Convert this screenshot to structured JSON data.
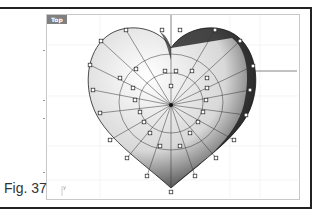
{
  "figure": {
    "label": "Fig. 37"
  },
  "viewport": {
    "title": "Top",
    "axis_label": "y",
    "grid_color": "#ececec",
    "axis_color": "#555555"
  },
  "model": {
    "name": "heart-surface",
    "center": [
      171,
      105
    ],
    "control_points": [
      [
        126,
        30
      ],
      [
        162,
        30
      ],
      [
        180,
        30
      ],
      [
        215,
        30
      ],
      [
        101,
        41
      ],
      [
        240,
        41
      ],
      [
        90,
        65
      ],
      [
        253,
        66
      ],
      [
        93,
        90
      ],
      [
        250,
        90
      ],
      [
        100,
        113
      ],
      [
        246,
        115
      ],
      [
        110,
        140
      ],
      [
        234,
        140
      ],
      [
        127,
        158
      ],
      [
        216,
        158
      ],
      [
        147,
        176
      ],
      [
        195,
        176
      ],
      [
        171,
        192
      ],
      [
        136,
        69
      ],
      [
        165,
        71
      ],
      [
        176,
        71
      ],
      [
        192,
        71
      ],
      [
        120,
        78
      ],
      [
        207,
        78
      ],
      [
        133,
        88
      ],
      [
        207,
        88
      ],
      [
        135,
        100
      ],
      [
        206,
        100
      ],
      [
        140,
        112
      ],
      [
        203,
        112
      ],
      [
        144,
        122
      ],
      [
        198,
        122
      ],
      [
        150,
        133
      ],
      [
        190,
        133
      ],
      [
        160,
        146
      ],
      [
        180,
        146
      ],
      [
        171,
        86
      ]
    ]
  }
}
